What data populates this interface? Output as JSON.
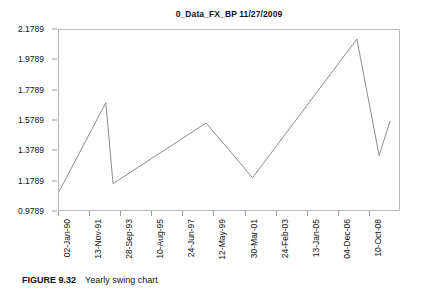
{
  "chart_data": {
    "type": "line",
    "title": "0_Data_FX_BP 11/27/2009",
    "xlabel": "",
    "ylabel": "",
    "grid": false,
    "legend": false,
    "ylim": [
      0.9789,
      2.1789
    ],
    "ytick_labels": [
      "2.1789",
      "1.9789",
      "1.7789",
      "1.5789",
      "1.3789",
      "1.1789",
      "0.9789"
    ],
    "ytick_values": [
      2.1789,
      1.9789,
      1.7789,
      1.5789,
      1.3789,
      1.1789,
      0.9789
    ],
    "xtick_labels": [
      "02-Jan-90",
      "13-Nov-91",
      "28-Sep-93",
      "10-Aug-95",
      "24-Jun-97",
      "12-May-99",
      "30-Mar-01",
      "24-Feb-03",
      "13-Jan-05",
      "04-Dec-06",
      "10-Oct-08"
    ],
    "series": [
      {
        "name": "0_Data_FX_BP",
        "color": "#8c8c8c",
        "x": [
          "02-Jan-90",
          "11-Sep-92",
          "21-Feb-94",
          "12-May-99",
          "30-Mar-01",
          "11-Jul-07",
          "05-Feb-09",
          "27-Nov-09"
        ],
        "x_fraction": [
          0.0,
          0.137,
          0.158,
          0.43,
          0.566,
          0.871,
          0.936,
          0.968
        ],
        "values": [
          1.1129,
          1.6997,
          1.1657,
          1.5657,
          1.2052,
          2.1195,
          1.3513,
          1.5789
        ],
        "point_labels": [
          "1.1129",
          "1.6997",
          "1.1657",
          "1.5657",
          "1.2052",
          "2.1195",
          "1.3513",
          "1.5789"
        ]
      }
    ]
  },
  "figure": {
    "caption_label": "FIGURE 9.32",
    "caption_text": "Yearly swing chart"
  },
  "colors": {
    "series_line": "#8c8c8c",
    "axis_frame": "#b9b9b9",
    "text": "#111111"
  }
}
